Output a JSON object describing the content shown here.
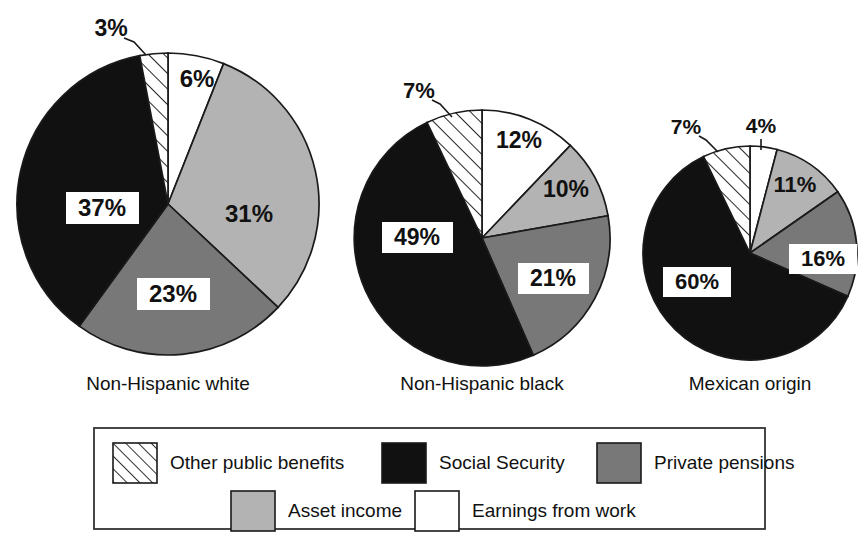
{
  "chart_data": {
    "type": "pie",
    "title": "",
    "subtitle": "",
    "xlabel": "",
    "ylabel": "",
    "units": "percent",
    "legend_position": "bottom",
    "grid": false,
    "categories": [
      "Earnings from work",
      "Asset income",
      "Private pensions",
      "Social Security",
      "Other public benefits"
    ],
    "charts": [
      {
        "name": "Non-Hispanic white",
        "caption": "Non-Hispanic white",
        "values": [
          6,
          31,
          23,
          37,
          3
        ],
        "labels": [
          "6%",
          "31%",
          "23%",
          "37%",
          "3%"
        ]
      },
      {
        "name": "Non-Hispanic black",
        "caption": "Non-Hispanic black",
        "values": [
          12,
          10,
          21,
          49,
          7
        ],
        "labels": [
          "12%",
          "10%",
          "21%",
          "49%",
          "7%"
        ]
      },
      {
        "name": "Mexican origin",
        "caption": "Mexican origin",
        "values": [
          4,
          11,
          16,
          60,
          7
        ],
        "labels": [
          "4%",
          "11%",
          "16%",
          "60%",
          "7%"
        ]
      }
    ],
    "colors": {
      "earnings_from_work": "#ffffff",
      "asset_income": "#b3b3b3",
      "private_pensions": "#787878",
      "social_security": "#111111",
      "other_public_benefits": "#ffffff",
      "outline": "#1a1a1a",
      "background": "#ffffff"
    }
  },
  "captions": {
    "pie1": "Non-Hispanic white",
    "pie2": "Non-Hispanic black",
    "pie3": "Mexican origin"
  },
  "pie1": {
    "earnings": "6%",
    "asset": "31%",
    "pensions": "23%",
    "social": "37%",
    "other": "3%"
  },
  "pie2": {
    "earnings": "12%",
    "asset": "10%",
    "pensions": "21%",
    "social": "49%",
    "other": "7%"
  },
  "pie3": {
    "earnings": "4%",
    "asset": "11%",
    "pensions": "16%",
    "social": "60%",
    "other": "7%"
  },
  "legend": {
    "items": [
      {
        "label": "Other public benefits",
        "swatch": "hatched"
      },
      {
        "label": "Social Security",
        "swatch": "black"
      },
      {
        "label": "Private pensions",
        "swatch": "dark-gray"
      },
      {
        "label": "Asset income",
        "swatch": "light-gray"
      },
      {
        "label": "Earnings from work",
        "swatch": "white"
      }
    ]
  }
}
